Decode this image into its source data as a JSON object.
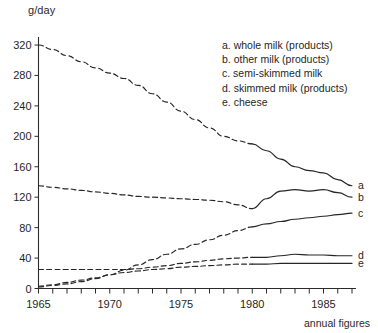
{
  "figure": {
    "y_axis_unit": "g/day",
    "footnote": "annual figures"
  },
  "legend": {
    "items": [
      {
        "key": "a",
        "label": "a. whole milk (products)"
      },
      {
        "key": "b",
        "label": "b. other milk (products)"
      },
      {
        "key": "c",
        "label": "c. semi-skimmed milk"
      },
      {
        "key": "d",
        "label": "d. skimmed milk (products)"
      },
      {
        "key": "e",
        "label": "e. cheese"
      }
    ]
  },
  "series_end_labels": {
    "a": "a",
    "b": "b",
    "c": "c",
    "d": "d",
    "e": "e"
  },
  "chart_data": {
    "type": "line",
    "title": "",
    "subtitle": "",
    "xlabel": "",
    "ylabel": "g/day",
    "annotations": [
      "g/day",
      "annual figures"
    ],
    "grid": false,
    "legend_position": "top-right",
    "xlim": [
      1965,
      1987
    ],
    "ylim": [
      0,
      320
    ],
    "yticks": [
      0,
      40,
      80,
      120,
      160,
      200,
      240,
      280,
      320
    ],
    "ytick_labels": [
      "0",
      "40",
      "80",
      "120",
      "160",
      "200",
      "240",
      "280",
      "320"
    ],
    "xticks": [
      1965,
      1966,
      1967,
      1968,
      1969,
      1970,
      1971,
      1972,
      1973,
      1974,
      1975,
      1976,
      1977,
      1978,
      1979,
      1980,
      1981,
      1982,
      1983,
      1984,
      1985,
      1986,
      1987
    ],
    "xtick_labels_shown": [
      "1965",
      "1970",
      "1975",
      "1980",
      "1985"
    ],
    "xtick_labels_shown_at": [
      1965,
      1970,
      1975,
      1980,
      1985
    ],
    "x": [
      1965,
      1966,
      1967,
      1968,
      1969,
      1970,
      1971,
      1972,
      1973,
      1974,
      1975,
      1976,
      1977,
      1978,
      1979,
      1980,
      1981,
      1982,
      1983,
      1984,
      1985,
      1986,
      1987
    ],
    "series": [
      {
        "name": "a. whole milk (products)",
        "key": "a",
        "linestyle_by_segment": "dashed until 1980, solid after",
        "solid_from": 1980,
        "values": [
          320,
          314,
          306,
          298,
          290,
          283,
          276,
          267,
          256,
          245,
          233,
          222,
          211,
          200,
          194,
          190,
          181,
          170,
          160,
          155,
          152,
          143,
          135
        ]
      },
      {
        "name": "b. other milk (products)",
        "key": "b",
        "linestyle_by_segment": "dashed until 1980, solid after",
        "solid_from": 1980,
        "values": [
          135,
          133,
          131,
          129,
          127,
          125,
          123,
          121,
          120,
          119,
          118,
          117,
          116,
          114,
          110,
          105,
          118,
          128,
          130,
          128,
          130,
          126,
          120
        ]
      },
      {
        "name": "c. semi-skimmed milk",
        "key": "c",
        "linestyle_by_segment": "dashed until 1980, solid after",
        "solid_from": 1980,
        "values": [
          2,
          4,
          6,
          9,
          13,
          18,
          24,
          31,
          38,
          45,
          52,
          58,
          64,
          70,
          76,
          81,
          85,
          88,
          91,
          93,
          95,
          97,
          99
        ]
      },
      {
        "name": "d. skimmed milk (products)",
        "key": "d",
        "linestyle_by_segment": "dashed until 1980, solid after",
        "solid_from": 1980,
        "values": [
          25,
          25,
          25,
          25,
          25,
          25,
          25,
          26,
          28,
          30,
          33,
          35,
          37,
          39,
          40,
          41,
          41,
          43,
          45,
          44,
          44,
          43,
          43
        ]
      },
      {
        "name": "e. cheese",
        "key": "e",
        "linestyle_by_segment": "dashed until 1980, solid after",
        "solid_from": 1980,
        "values": [
          3,
          5,
          8,
          11,
          14,
          18,
          21,
          23,
          25,
          26,
          28,
          29,
          30,
          31,
          32,
          32,
          32,
          33,
          33,
          33,
          33,
          33,
          33
        ]
      }
    ]
  }
}
